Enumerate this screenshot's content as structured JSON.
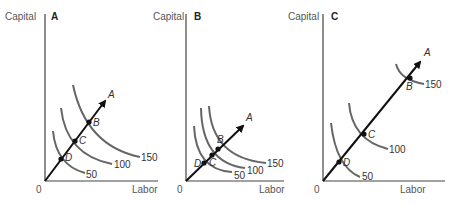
{
  "figure": {
    "y_axis_label": "Capital",
    "x_axis_label": "Labor",
    "origin_label": "0",
    "ray_label": "A",
    "panels": [
      {
        "id": "A",
        "title": "A",
        "points": [
          {
            "name": "D",
            "output": 50
          },
          {
            "name": "C",
            "output": 100
          },
          {
            "name": "B",
            "output": 150
          }
        ],
        "isoquants": [
          "50",
          "100",
          "150"
        ],
        "description": "Constant returns to scale: isoquants equally spaced along ray"
      },
      {
        "id": "B",
        "title": "B",
        "points": [
          {
            "name": "D",
            "output": 50
          },
          {
            "name": "C",
            "output": 100
          },
          {
            "name": "B",
            "output": 150
          }
        ],
        "isoquants": [
          "50",
          "100",
          "150"
        ],
        "description": "Increasing returns to scale: isoquants closer together along ray"
      },
      {
        "id": "C",
        "title": "C",
        "points": [
          {
            "name": "D",
            "output": 50
          },
          {
            "name": "C",
            "output": 100
          },
          {
            "name": "B",
            "output": 150
          }
        ],
        "isoquants": [
          "50",
          "100",
          "150"
        ],
        "description": "Decreasing returns to scale: isoquants farther apart along ray"
      }
    ]
  }
}
